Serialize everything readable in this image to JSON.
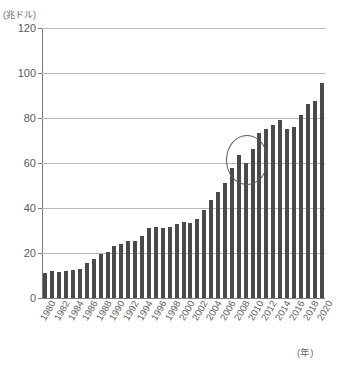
{
  "header": {
    "clipped_title_left": "",
    "clipped_title_right": ""
  },
  "axes": {
    "y_unit_label": "(兆ドル)",
    "x_unit_label": "(年)"
  },
  "chart_data": {
    "type": "bar",
    "title": "",
    "subtitle": "",
    "xlabel": "(年)",
    "ylabel": "(兆ドル)",
    "ylim": [
      0,
      120
    ],
    "yticks": [
      0,
      20,
      40,
      60,
      80,
      100,
      120
    ],
    "ytick_labels": [
      "0",
      "20",
      "40",
      "60",
      "80",
      "100",
      "120"
    ],
    "grid": true,
    "legend": false,
    "bar_color": "#4a4a4a",
    "x": [
      1980,
      1981,
      1982,
      1983,
      1984,
      1985,
      1986,
      1987,
      1988,
      1989,
      1990,
      1991,
      1992,
      1993,
      1994,
      1995,
      1996,
      1997,
      1998,
      1999,
      2000,
      2001,
      2002,
      2003,
      2004,
      2005,
      2006,
      2007,
      2008,
      2009,
      2010,
      2011,
      2012,
      2013,
      2014,
      2015,
      2016,
      2017,
      2018,
      2019,
      2020
    ],
    "xtick_labels": [
      "1980",
      "1982",
      "1984",
      "1986",
      "1988",
      "1990",
      "1992",
      "1994",
      "1996",
      "1998",
      "2000",
      "2002",
      "2004",
      "2006",
      "2008",
      "2010",
      "2012",
      "2014",
      "2016",
      "2018",
      "2020"
    ],
    "values": [
      11.3,
      11.8,
      11.6,
      11.9,
      12.3,
      12.9,
      15.6,
      17.5,
      19.7,
      20.5,
      23.0,
      24.0,
      25.4,
      25.5,
      27.4,
      30.9,
      31.4,
      31.3,
      31.6,
      32.7,
      33.8,
      33.4,
      34.9,
      38.9,
      43.6,
      47.2,
      51.2,
      57.6,
      63.5,
      60.2,
      66.1,
      73.5,
      74.9,
      77.0,
      79.1,
      75.0,
      76.1,
      81.2,
      86.1,
      87.7,
      95.5
    ],
    "annotations": [
      {
        "type": "ellipse",
        "label": "financial-crisis-highlight",
        "x_range": [
          2008,
          2010
        ],
        "y_center": 62,
        "description": "楕円で強調された2008〜2010年"
      }
    ]
  }
}
